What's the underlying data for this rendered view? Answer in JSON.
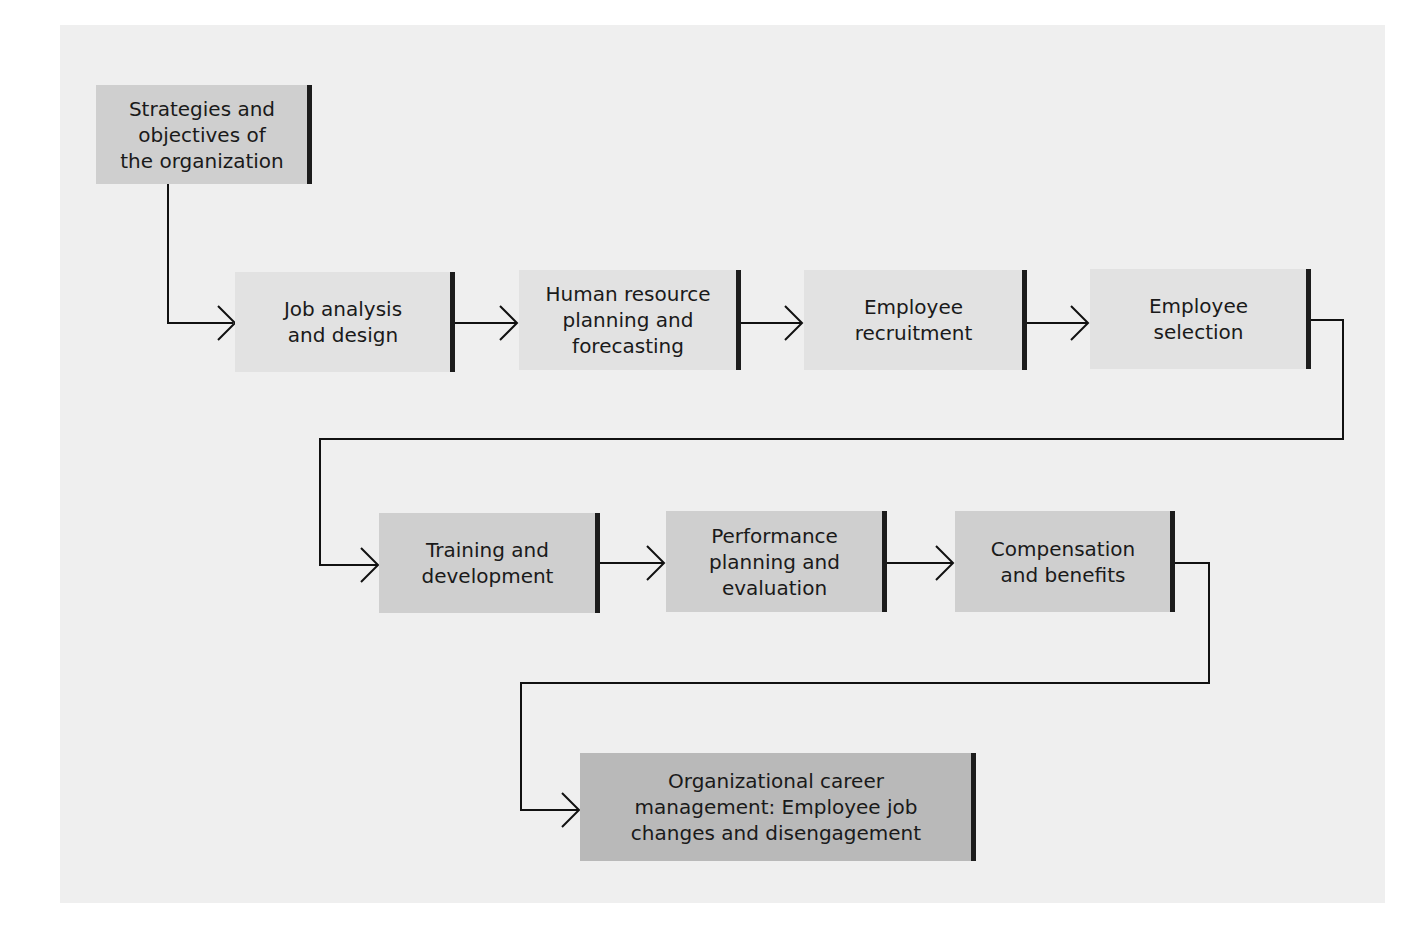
{
  "diagram": {
    "nodes": [
      {
        "id": "strategies",
        "label": "Strategies and\nobjectives of\nthe organization"
      },
      {
        "id": "job-analysis",
        "label": "Job analysis\nand design"
      },
      {
        "id": "hr-planning",
        "label": "Human resource\nplanning and\nforecasting"
      },
      {
        "id": "recruitment",
        "label": "Employee\nrecruitment"
      },
      {
        "id": "selection",
        "label": "Employee\nselection"
      },
      {
        "id": "training",
        "label": "Training and\ndevelopment"
      },
      {
        "id": "performance",
        "label": "Performance\nplanning and\nevaluation"
      },
      {
        "id": "compensation",
        "label": "Compensation\nand benefits"
      },
      {
        "id": "career",
        "label": "Organizational career\nmanagement: Employee job\nchanges and disengagement"
      }
    ],
    "edges": [
      {
        "from": "strategies",
        "to": "job-analysis"
      },
      {
        "from": "job-analysis",
        "to": "hr-planning"
      },
      {
        "from": "hr-planning",
        "to": "recruitment"
      },
      {
        "from": "recruitment",
        "to": "selection"
      },
      {
        "from": "selection",
        "to": "training"
      },
      {
        "from": "training",
        "to": "performance"
      },
      {
        "from": "performance",
        "to": "compensation"
      },
      {
        "from": "compensation",
        "to": "career"
      }
    ]
  }
}
